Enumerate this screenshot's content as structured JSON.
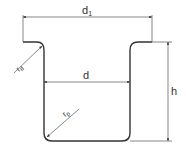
{
  "diagram": {
    "colors": {
      "stroke": "#333333",
      "dim": "#555555",
      "background": "#ffffff"
    },
    "labels": {
      "flange_diameter": {
        "main": "d",
        "sub": "1"
      },
      "inner_diameter": {
        "main": "d"
      },
      "height": {
        "main": "h"
      },
      "die_radius": {
        "main": "r",
        "sub": "d"
      },
      "punch_radius": {
        "main": "r",
        "sub": "p"
      }
    }
  }
}
